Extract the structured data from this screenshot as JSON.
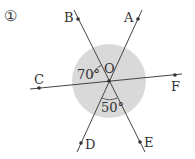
{
  "problem_number": "①",
  "center_label": "O",
  "points": {
    "A": "A",
    "B": "B",
    "C": "C",
    "D": "D",
    "E": "E",
    "F": "F"
  },
  "angles": {
    "angle_BOC": "70°",
    "angle_DOE": "50°"
  },
  "colors": {
    "shading": "#d9d9d9",
    "line": "#444444"
  }
}
